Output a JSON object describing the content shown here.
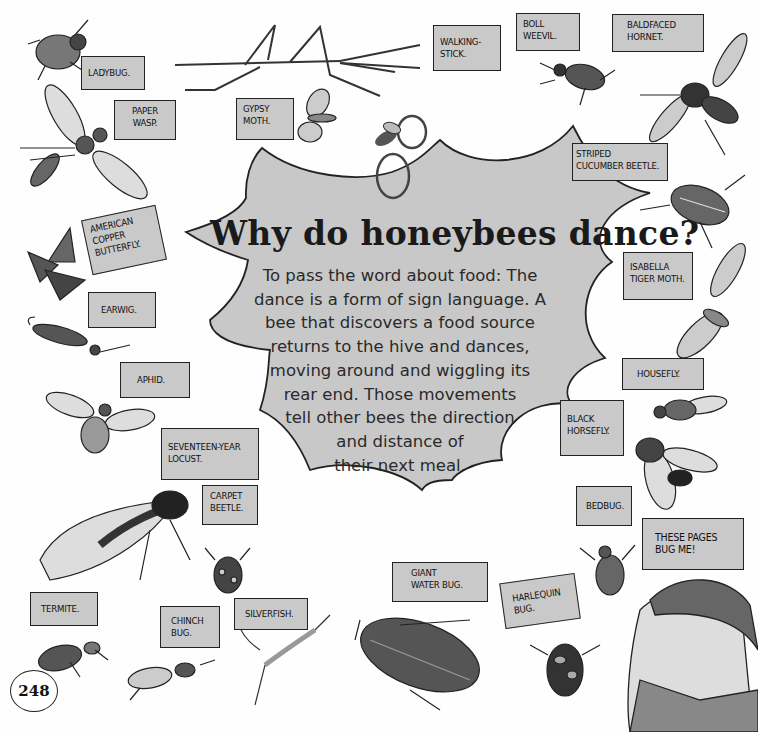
{
  "page": {
    "title": "Why do honeybees dance?",
    "body_lines": [
      "To pass the word about food: The",
      "dance is a form of sign language. A",
      "bee that discovers a food source",
      "returns to the hive and dances,",
      "moving around and wiggling its",
      "rear end. Those movements",
      "tell other bees the direction",
      "and distance of",
      "their next meal."
    ],
    "page_number": "248",
    "colors": {
      "burst_fill": "#c8c8c8",
      "label_fill": "#c9c9c9",
      "outline": "#222222",
      "background": "#fefefe"
    }
  },
  "labels": {
    "ladybug": [
      "LADYBUG."
    ],
    "paper_wasp": [
      "PAPER",
      "WASP."
    ],
    "walking_stick": [
      "WALKING-",
      "STICK."
    ],
    "gypsy_moth": [
      "GYPSY",
      "MOTH."
    ],
    "boll_weevil": [
      "BOLL",
      "WEEVIL."
    ],
    "baldfaced_hornet": [
      "BALDFACED",
      "HORNET."
    ],
    "striped_cucumber_beetle": [
      "STRIPED",
      "CUCUMBER BEETLE."
    ],
    "american_copper_butterfly": [
      "AMERICAN",
      "COPPER",
      "BUTTERFLY."
    ],
    "earwig": [
      "EARWIG."
    ],
    "isabella_tiger_moth": [
      "ISABELLA",
      "TIGER MOTH."
    ],
    "aphid": [
      "APHID."
    ],
    "housefly": [
      "HOUSEFLY."
    ],
    "black_horsefly": [
      "BLACK",
      "HORSEFLY."
    ],
    "seventeen_year_locust": [
      "SEVENTEEN-YEAR",
      "LOCUST."
    ],
    "carpet_beetle": [
      "CARPET",
      "BEETLE."
    ],
    "bedbug": [
      "BEDBUG."
    ],
    "these_pages": [
      "THESE PAGES",
      "BUG ME!"
    ],
    "giant_water_bug": [
      "GIANT",
      "WATER BUG."
    ],
    "harlequin_bug": [
      "HARLEQUIN",
      "BUG."
    ],
    "termite": [
      "TERMITE."
    ],
    "chinch_bug": [
      "CHINCH",
      "BUG."
    ],
    "silverfish": [
      "SILVERFISH."
    ]
  }
}
